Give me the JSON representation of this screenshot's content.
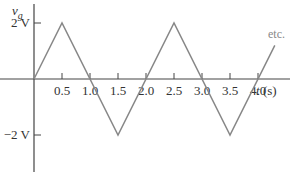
{
  "chart_data": {
    "type": "line",
    "title": "",
    "ylabel": "v_g",
    "xlabel": "t (s)",
    "y_tick_labels": [
      "2 V",
      "−2 V"
    ],
    "y_ticks": [
      2,
      -2
    ],
    "x_tick_labels": [
      "0.5",
      "1.0",
      "1.5",
      "2.0",
      "2.5",
      "3.0",
      "3.5",
      "4.0"
    ],
    "x_ticks": [
      0.5,
      1.0,
      1.5,
      2.0,
      2.5,
      3.0,
      3.5,
      4.0
    ],
    "annotation": "etc.",
    "grid": false,
    "xlim": [
      0,
      4.5
    ],
    "ylim": [
      -3,
      2.8
    ],
    "series": [
      {
        "name": "v_g (triangular wave)",
        "x": [
          0,
          0.5,
          1.5,
          2.5,
          3.5,
          4.3
        ],
        "values": [
          0,
          2,
          -2,
          2,
          -2,
          1.2
        ]
      }
    ]
  },
  "labels": {
    "ylabel_main": "v",
    "ylabel_sub": "g",
    "xlabel": "t (s)",
    "etc": "etc."
  }
}
